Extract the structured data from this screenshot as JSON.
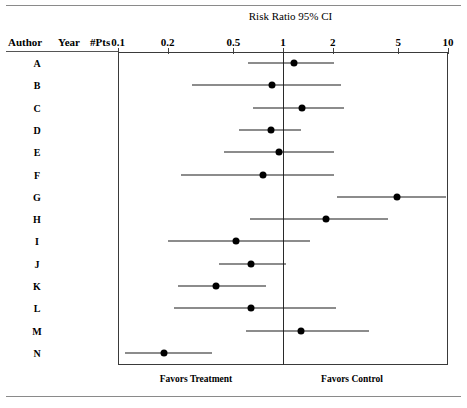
{
  "title": "Risk Ratio 95% CI",
  "columns": {
    "author": "Author",
    "year": "Year",
    "pts": "#Pts"
  },
  "footer": {
    "left": "Favors Treatment",
    "right": "Favors Control"
  },
  "axis": {
    "label": "Risk Ratio 95% CI",
    "scale": "log",
    "ticks": [
      "0.1",
      "0.2",
      "0.5",
      "1",
      "2",
      "5",
      "10"
    ],
    "tick_values": [
      0.1,
      0.2,
      0.5,
      1,
      2,
      5,
      10
    ],
    "min": 0.1,
    "max": 10,
    "null_value": 1
  },
  "colors": {
    "marker": "#000000",
    "line": "#1a1a1a",
    "frame": "#3a3a3a",
    "null_line": "#2a2a2a",
    "rule": "#8a8a8a",
    "background": "#ffffff"
  },
  "chart_data": {
    "type": "forest",
    "title": "Risk Ratio 95% CI",
    "xlabel": "Risk Ratio 95% CI",
    "ylabel": "",
    "scale": "log",
    "xlim": [
      0.1,
      10
    ],
    "xticks": [
      0.1,
      0.2,
      0.5,
      1,
      2,
      5,
      10
    ],
    "xticklabels": [
      "0.1",
      "0.2",
      "0.5",
      "1",
      "2",
      "5",
      "10"
    ],
    "null_line": 1,
    "grid": false,
    "legend": "none",
    "annotations": [
      "Favors Treatment",
      "Favors Control"
    ],
    "categories": [
      "A",
      "B",
      "C",
      "D",
      "E",
      "F",
      "G",
      "H",
      "I",
      "J",
      "K",
      "L",
      "M",
      "N"
    ],
    "rows": [
      {
        "author": "A",
        "year": "",
        "pts": "",
        "estimate": 1.16,
        "lower": 0.61,
        "upper": 2.04
      },
      {
        "author": "B",
        "year": "",
        "pts": "",
        "estimate": 0.86,
        "lower": 0.28,
        "upper": 2.26
      },
      {
        "author": "C",
        "year": "",
        "pts": "",
        "estimate": 1.3,
        "lower": 0.66,
        "upper": 2.35
      },
      {
        "author": "D",
        "year": "",
        "pts": "",
        "estimate": 0.84,
        "lower": 0.54,
        "upper": 1.28
      },
      {
        "author": "E",
        "year": "",
        "pts": "",
        "estimate": 0.94,
        "lower": 0.44,
        "upper": 2.04
      },
      {
        "author": "F",
        "year": "",
        "pts": "",
        "estimate": 0.76,
        "lower": 0.24,
        "upper": 2.04
      },
      {
        "author": "G",
        "year": "",
        "pts": "",
        "estimate": 4.9,
        "lower": 2.12,
        "upper": 9.7
      },
      {
        "author": "H",
        "year": "",
        "pts": "",
        "estimate": 1.82,
        "lower": 0.63,
        "upper": 4.3
      },
      {
        "author": "I",
        "year": "",
        "pts": "",
        "estimate": 0.52,
        "lower": 0.2,
        "upper": 1.46
      },
      {
        "author": "J",
        "year": "",
        "pts": "",
        "estimate": 0.64,
        "lower": 0.41,
        "upper": 1.04
      },
      {
        "author": "K",
        "year": "",
        "pts": "",
        "estimate": 0.39,
        "lower": 0.23,
        "upper": 0.79
      },
      {
        "author": "L",
        "year": "",
        "pts": "",
        "estimate": 0.64,
        "lower": 0.22,
        "upper": 2.1
      },
      {
        "author": "M",
        "year": "",
        "pts": "",
        "estimate": 1.28,
        "lower": 0.6,
        "upper": 3.3
      },
      {
        "author": "N",
        "year": "",
        "pts": "",
        "estimate": 0.19,
        "lower": 0.11,
        "upper": 0.37
      }
    ]
  }
}
